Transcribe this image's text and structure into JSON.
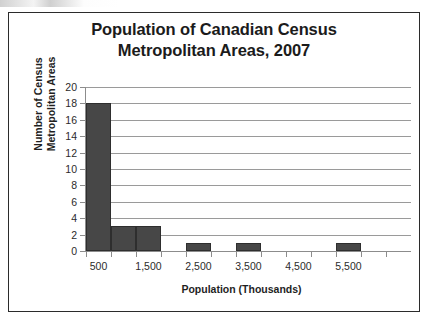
{
  "figure": {
    "title_line1": "Population of Canadian Census",
    "title_line2": "Metropolitan Areas, 2007"
  },
  "axis": {
    "y_title_line1": "Number of Census",
    "y_title_line2": "Metropolitan Areas",
    "x_title": "Population (Thousands)"
  },
  "chart_data": {
    "type": "bar",
    "title": "Population of Canadian Census Metropolitan Areas, 2007",
    "xlabel": "Population (Thousands)",
    "ylabel": "Number of Census Metropolitan Areas",
    "grid": true,
    "legend": "none",
    "xlim": [
      0,
      6500
    ],
    "ylim": [
      0,
      20
    ],
    "ytick_labels": [
      "0",
      "2",
      "4",
      "6",
      "8",
      "10",
      "12",
      "14",
      "16",
      "18",
      "20"
    ],
    "ytick_values": [
      0,
      2,
      4,
      6,
      8,
      10,
      12,
      14,
      16,
      18,
      20
    ],
    "xtick_labels": [
      "500",
      "1,500",
      "2,500",
      "3,500",
      "4,500",
      "5,500"
    ],
    "xtick_values": [
      500,
      1500,
      2500,
      3500,
      4500,
      5500
    ],
    "bin_width": 500,
    "bin_edges": [
      250,
      750,
      1250,
      1750,
      2250,
      2750,
      3250,
      3750,
      4250,
      4750,
      5250,
      5750
    ],
    "categories": [
      "500",
      "1,000",
      "1,500",
      "2,000",
      "2,500",
      "3,000",
      "3,500",
      "4,000",
      "4,500",
      "5,000",
      "5,500"
    ],
    "values": [
      18,
      3,
      3,
      0,
      1,
      0,
      1,
      0,
      0,
      0,
      1
    ],
    "bar_color": "#474747",
    "bar_edge_color": "#2e2e2e",
    "gridline_color": "#9a9a9a",
    "background_color": "#ffffff",
    "frame_color": "#2b2b2b"
  }
}
